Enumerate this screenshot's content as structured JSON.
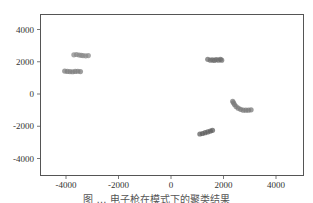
{
  "chart_data": {
    "type": "scatter",
    "title": "",
    "xlabel": "",
    "ylabel": "",
    "xlim": [
      -5000,
      5000
    ],
    "ylim": [
      -5000,
      5000
    ],
    "xticks": [
      -4000,
      -2000,
      0,
      2000,
      4000
    ],
    "yticks": [
      4000,
      2000,
      0,
      -2000,
      -4000
    ],
    "xtick_labels": [
      "-4000",
      "-2000",
      "0",
      "2000",
      "4000"
    ],
    "ytick_labels": [
      "4000",
      "2000",
      "0",
      "-2000",
      "-4000"
    ],
    "grid": false,
    "legend": null,
    "series": [
      {
        "name": "cluster-1",
        "color": "#8a8a8a",
        "points": [
          [
            -3700,
            2430
          ],
          [
            -3600,
            2450
          ],
          [
            -3500,
            2420
          ],
          [
            -3420,
            2400
          ],
          [
            -3350,
            2380
          ],
          [
            -3250,
            2370
          ],
          [
            -3150,
            2380
          ]
        ]
      },
      {
        "name": "cluster-2",
        "color": "#7d7d7d",
        "points": [
          [
            -4050,
            1420
          ],
          [
            -3950,
            1400
          ],
          [
            -3850,
            1390
          ],
          [
            -3750,
            1380
          ],
          [
            -3650,
            1400
          ],
          [
            -3550,
            1410
          ],
          [
            -3450,
            1390
          ]
        ]
      },
      {
        "name": "cluster-3",
        "color": "#6e6e6e",
        "points": [
          [
            1400,
            2150
          ],
          [
            1500,
            2100
          ],
          [
            1580,
            2120
          ],
          [
            1650,
            2080
          ],
          [
            1720,
            2140
          ],
          [
            1800,
            2100
          ],
          [
            1880,
            2150
          ],
          [
            1930,
            2100
          ]
        ]
      },
      {
        "name": "cluster-4",
        "color": "#7a7a7a",
        "points": [
          [
            2350,
            -450
          ],
          [
            2380,
            -550
          ],
          [
            2420,
            -650
          ],
          [
            2480,
            -780
          ],
          [
            2560,
            -880
          ],
          [
            2650,
            -950
          ],
          [
            2750,
            -1000
          ],
          [
            2850,
            -1000
          ],
          [
            2950,
            -1000
          ],
          [
            3050,
            -980
          ]
        ]
      },
      {
        "name": "cluster-5",
        "color": "#5e5e5e",
        "points": [
          [
            1100,
            -2480
          ],
          [
            1200,
            -2450
          ],
          [
            1300,
            -2400
          ],
          [
            1400,
            -2350
          ],
          [
            1500,
            -2300
          ],
          [
            1580,
            -2250
          ]
        ]
      }
    ]
  },
  "caption": "图 … 电子枪在模式下的聚类结果"
}
